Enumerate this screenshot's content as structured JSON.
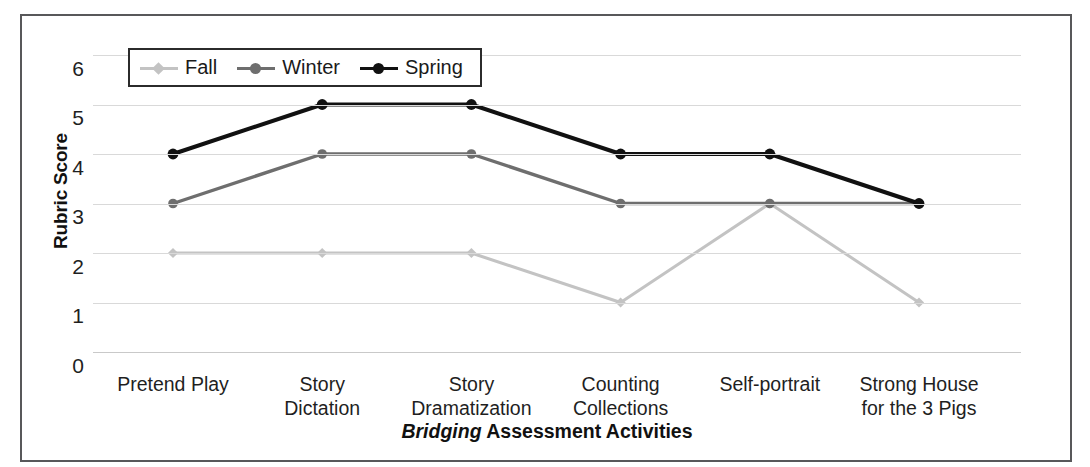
{
  "chart_data": {
    "type": "line",
    "title": "",
    "xlabel": "Bridging Assessment Activities",
    "xlabel_emphasis": "Bridging",
    "xlabel_rest": " Assessment Activities",
    "ylabel": "Rubric Score",
    "categories": [
      "Pretend Play",
      "Story Dictation",
      "Story Dramatization",
      "Counting Collections",
      "Self-portrait",
      "Strong House for the 3 Pigs"
    ],
    "category_lines": [
      [
        "Pretend Play"
      ],
      [
        "Story",
        "Dictation"
      ],
      [
        "Story",
        "Dramatization"
      ],
      [
        "Counting",
        "Collections"
      ],
      [
        "Self-portrait"
      ],
      [
        "Strong House",
        "for the 3 Pigs"
      ]
    ],
    "series": [
      {
        "name": "Fall",
        "color": "#c3c3c3",
        "marker": "diamond",
        "values": [
          2,
          2,
          2,
          1,
          3,
          1
        ]
      },
      {
        "name": "Winter",
        "color": "#6e6e6e",
        "marker": "circle",
        "values": [
          3,
          4,
          4,
          3,
          3,
          3
        ]
      },
      {
        "name": "Spring",
        "color": "#111111",
        "marker": "circle",
        "values": [
          4,
          5,
          5,
          4,
          4,
          3
        ]
      }
    ],
    "yticks": [
      6,
      5,
      4,
      3,
      2,
      1,
      0
    ],
    "ylim": [
      0,
      6
    ],
    "grid": true,
    "legend_position": "top-left-inside",
    "axis_colors": {
      "gridline": "#d9d9d9",
      "frame": "#58585a",
      "legend_border": "#2b2b2b"
    }
  },
  "legend": {
    "entries": [
      {
        "label": "Fall"
      },
      {
        "label": "Winter"
      },
      {
        "label": "Spring"
      }
    ]
  }
}
